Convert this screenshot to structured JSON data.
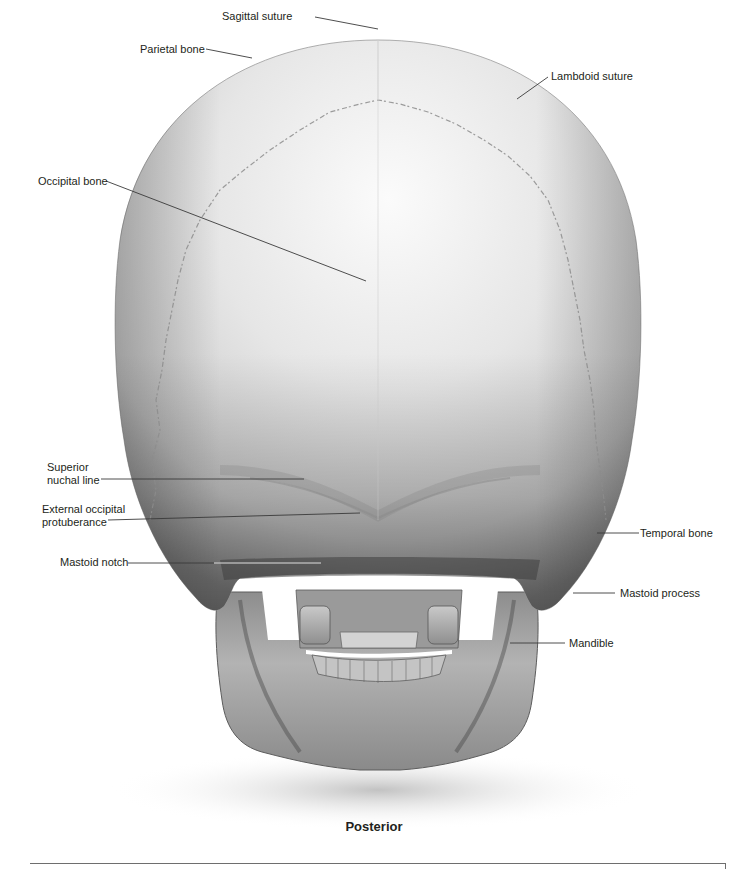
{
  "figure": {
    "view_caption": "Posterior",
    "labels": [
      {
        "id": "sagittal-suture",
        "text": "Sagittal suture",
        "x": 222,
        "y": 12,
        "anchor": "left",
        "line": [
          [
            345,
            17
          ],
          [
            378,
            24
          ]
        ]
      },
      {
        "id": "parietal-bone",
        "text": "Parietal bone",
        "x": 140,
        "y": 43,
        "anchor": "left",
        "line": [
          [
            206,
            49
          ],
          [
            252,
            58
          ]
        ]
      },
      {
        "id": "lambdoid-suture",
        "text": "Lambdoid suture",
        "x": 551,
        "y": 71,
        "anchor": "left",
        "line": [
          [
            549,
            77
          ],
          [
            519,
            101
          ]
        ]
      },
      {
        "id": "occipital-bone",
        "text": "Occipital bone",
        "x": 38,
        "y": 175,
        "anchor": "left",
        "line": [
          [
            106,
            181
          ],
          [
            366,
            281
          ]
        ]
      },
      {
        "id": "superior-nuchal-line",
        "text": "Superior\nnuchal line",
        "x": 47,
        "y": 461,
        "anchor": "left",
        "multiline": true,
        "line": [
          [
            101,
            479
          ],
          [
            304,
            479
          ]
        ]
      },
      {
        "id": "external-occipital-protuberance",
        "text": "External occipital\nprotuberance",
        "x": 42,
        "y": 503,
        "anchor": "left",
        "multiline": true,
        "line": [
          [
            108,
            520
          ],
          [
            360,
            513
          ]
        ]
      },
      {
        "id": "mastoid-notch",
        "text": "Mastoid notch",
        "x": 60,
        "y": 556,
        "anchor": "left",
        "line": [
          [
            128,
            563
          ],
          [
            321,
            563
          ]
        ]
      },
      {
        "id": "temporal-bone",
        "text": "Temporal bone",
        "x": 639,
        "y": 527,
        "anchor": "left",
        "line": [
          [
            597,
            533
          ],
          [
            639,
            533
          ]
        ]
      },
      {
        "id": "mastoid-process",
        "text": "Mastoid process",
        "x": 620,
        "y": 589,
        "anchor": "left",
        "line": [
          [
            573,
            593
          ],
          [
            615,
            593
          ]
        ]
      },
      {
        "id": "mandible",
        "text": "Mandible",
        "x": 569,
        "y": 639,
        "anchor": "left",
        "line": [
          [
            510,
            643
          ],
          [
            565,
            643
          ]
        ]
      }
    ]
  },
  "colors": {
    "text": "#231f20",
    "leader_line": "#3a3a3a",
    "bone_light": "#f2f2f2",
    "bone_mid": "#bdbdbd",
    "bone_dark": "#4a4a4a",
    "background": "#ffffff"
  }
}
